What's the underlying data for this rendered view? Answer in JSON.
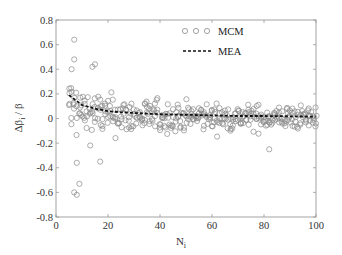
{
  "chart_data": {
    "type": "scatter",
    "title": "",
    "xlabel": "N_i",
    "ylabel": "Δβ_i / β",
    "xlim": [
      0,
      100
    ],
    "ylim": [
      -0.8,
      0.8
    ],
    "xticks": [
      0,
      20,
      40,
      60,
      80,
      100
    ],
    "yticks": [
      0.8,
      0.6,
      0.4,
      0.2,
      0,
      -0.2,
      -0.4,
      -0.6,
      -0.8
    ],
    "xtick_labels": [
      "0",
      "20",
      "40",
      "60",
      "80",
      "100"
    ],
    "ytick_labels": [
      "0.8",
      "0.6",
      "0.4",
      "0.2",
      "0",
      "-0.2",
      "-0.4",
      "-0.6",
      "-0.8"
    ],
    "grid": false,
    "legend_position": "upper right",
    "series": [
      {
        "name": "MCM",
        "kind": "scatter",
        "marker": "open-circle",
        "color": "#8a8a8a",
        "description": "Monte Carlo samples: multiple points per N_i from 5 to 100; spread decreases with N_i (≈ ±0.6 at N_i≈5, ≈ ±0.15 at N_i≈100), centred near 0",
        "x_range": [
          5,
          100
        ],
        "points_per_x": 4,
        "spread_at_x5": 0.55,
        "notable_points": [
          {
            "x": 7,
            "y": 0.64
          },
          {
            "x": 7,
            "y": 0.48
          },
          {
            "x": 6,
            "y": 0.4
          },
          {
            "x": 15,
            "y": 0.44
          },
          {
            "x": 14,
            "y": 0.42
          },
          {
            "x": 7,
            "y": -0.6
          },
          {
            "x": 8,
            "y": -0.62
          },
          {
            "x": 9,
            "y": -0.53
          },
          {
            "x": 8,
            "y": -0.36
          },
          {
            "x": 17,
            "y": -0.35
          },
          {
            "x": 82,
            "y": -0.25
          }
        ]
      },
      {
        "name": "MEA",
        "kind": "line",
        "style": "dashed",
        "color": "#111111",
        "x": [
          5,
          10,
          15,
          20,
          25,
          30,
          40,
          50,
          60,
          70,
          80,
          90,
          100
        ],
        "values": [
          0.19,
          0.11,
          0.08,
          0.06,
          0.05,
          0.045,
          0.035,
          0.03,
          0.025,
          0.02,
          0.02,
          0.018,
          0.015
        ]
      }
    ]
  },
  "legend": {
    "items": [
      {
        "label": "MCM"
      },
      {
        "label": "MEA"
      }
    ]
  },
  "axes": {
    "xlabel_main": "N",
    "xlabel_sub": "i",
    "ylabel_main": "Δβ",
    "ylabel_sub": "i",
    "ylabel_tail": " / β"
  }
}
